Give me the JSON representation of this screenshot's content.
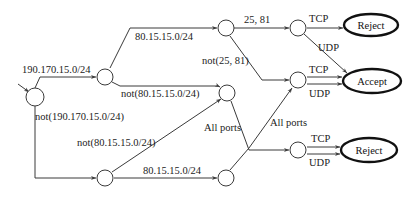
{
  "diagram": {
    "type": "packet-classification-decision-tree",
    "edges": {
      "src_match": "190.170.15.0/24",
      "src_not_match": "not(190.170.15.0/24)",
      "dst_match_top": "80.15.15.0/24",
      "dst_not_top": "not(80.15.15.0/24)",
      "dst_not_bottom": "not(80.15.15.0/24)",
      "dst_match_bottom": "80.15.15.0/24",
      "ports_match": "25, 81",
      "ports_not": "not(25, 81)",
      "all_ports_left": "All ports",
      "all_ports_right": "All ports",
      "proto_tcp_1": "TCP",
      "proto_udp_1": "UDP",
      "proto_tcp_2": "TCP",
      "proto_udp_2": "UDP",
      "proto_tcp_3": "TCP",
      "proto_udp_3": "UDP"
    },
    "terminals": {
      "reject_top": "Reject",
      "accept": "Accept",
      "reject_bottom": "Reject"
    }
  }
}
